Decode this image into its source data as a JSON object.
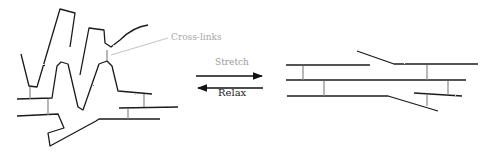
{
  "diagram": {
    "labels": {
      "crosslinks": "Cross-links",
      "stretch": "Stretch",
      "relax": "Relax"
    },
    "states": {
      "left": "relaxed-polymer-network",
      "right": "stretched-polymer-network"
    },
    "colors": {
      "chain": "#1a1a1a",
      "crosslink": "#888888",
      "label_gray": "#a8a8a8",
      "relax_text": "#222222"
    }
  }
}
